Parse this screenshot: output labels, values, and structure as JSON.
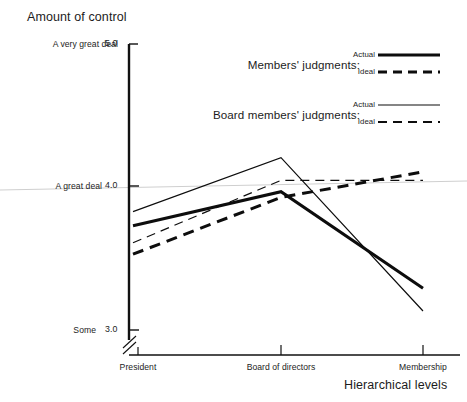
{
  "chart_data": {
    "type": "line",
    "title": "",
    "ylabel": "Amount of control",
    "xlabel": "Hierarchical levels",
    "categories": [
      "President",
      "Board of directors",
      "Membership"
    ],
    "x": [
      1,
      2,
      3
    ],
    "ylim": [
      2.85,
      5.0
    ],
    "yticks": [
      5.0,
      4.0,
      3.0
    ],
    "ytick_labels": [
      "5.0",
      "4.0",
      "3.0"
    ],
    "ytick_anchor_labels": [
      "A very great deal",
      "A great deal",
      "Some"
    ],
    "grid": "horizontal-at-4.0",
    "axis_break": true,
    "legend_position": "upper-right-inside",
    "series": [
      {
        "name": "Members' judgments — Actual",
        "group": "Members' judgments:",
        "key": "Actual",
        "style": "solid",
        "width": 3.0,
        "color": "#0d0d0d",
        "values": [
          3.72,
          3.96,
          3.28
        ]
      },
      {
        "name": "Members' judgments — Ideal",
        "group": "Members' judgments:",
        "key": "Ideal",
        "style": "dashed",
        "width": 3.0,
        "color": "#0d0d0d",
        "values": [
          3.52,
          3.92,
          4.1
        ]
      },
      {
        "name": "Board members' judgments — Actual",
        "group": "Board members' judgments:",
        "key": "Actual",
        "style": "solid",
        "width": 1.2,
        "color": "#0d0d0d",
        "values": [
          3.82,
          4.2,
          3.12
        ]
      },
      {
        "name": "Board members' judgments — Ideal",
        "group": "Board members' judgments:",
        "key": "Ideal",
        "style": "dashed",
        "width": 1.2,
        "color": "#0d0d0d",
        "values": [
          3.6,
          4.04,
          4.04
        ]
      }
    ]
  },
  "axes": {
    "y_title": "Amount of control",
    "x_title": "Hierarchical levels",
    "y_ticks": [
      {
        "anchor": "A very great deal",
        "value": "5.0"
      },
      {
        "anchor": "A great deal",
        "value": "4.0"
      },
      {
        "anchor": "Some",
        "value": "3.0"
      }
    ],
    "x_ticks": [
      "President",
      "Board of directors",
      "Membership"
    ]
  },
  "legend": {
    "groups": [
      {
        "label": "Members' judgments:",
        "keys": [
          {
            "label": "Actual",
            "style": "solid-thick"
          },
          {
            "label": "Ideal",
            "style": "dashed-thick"
          }
        ]
      },
      {
        "label": "Board members' judgments:",
        "keys": [
          {
            "label": "Actual",
            "style": "solid-thin"
          },
          {
            "label": "Ideal",
            "style": "dashed-thin"
          }
        ]
      }
    ]
  },
  "colors": {
    "ink": "#0d0d0d",
    "text": "#1c1c1c",
    "gridline": "#cfcfcf",
    "background": "#ffffff"
  }
}
